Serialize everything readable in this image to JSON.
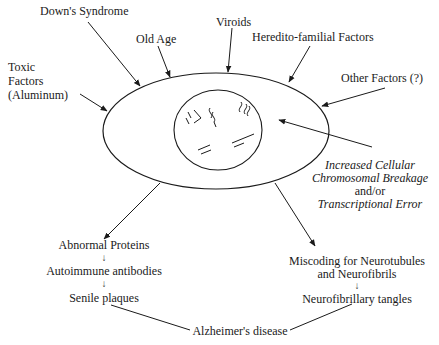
{
  "diagram": {
    "title": "",
    "causes": {
      "downs_syndrome": "Down's Syndrome",
      "old_age": "Old Age",
      "viroids": "Viroids",
      "hereditary": "Heredito-familial Factors",
      "other": "Other Factors (?)",
      "toxic_line1": "Toxic",
      "toxic_line2": "Factors",
      "toxic_line3": "(Aluminum)"
    },
    "cell_effect": {
      "line1": "Increased Cellular",
      "line2": "Chromosomal Breakage",
      "line3": "and/or",
      "line4": "Transcriptional Error"
    },
    "left_branch": {
      "step1": "Abnormal Proteins",
      "step2": "Autoimmune antibodies",
      "step3": "Senile plaques"
    },
    "right_branch": {
      "step1_line1": "Miscoding for Neurotubules",
      "step1_line2": "and Neurofibrils",
      "step2": "Neurofibrillary tangles"
    },
    "outcome": "Alzheimer's disease",
    "small_arrow_glyph": "↓"
  }
}
